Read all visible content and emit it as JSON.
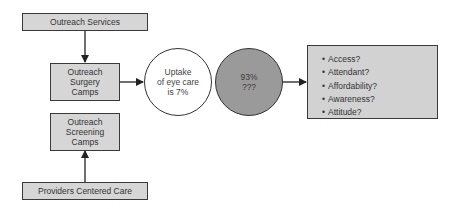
{
  "diagram": {
    "nodes": {
      "outreach_services": {
        "label": "Outreach Services"
      },
      "surgery_camps": {
        "lines": [
          "Outreach",
          "Surgery",
          "Camps"
        ]
      },
      "screening_camps": {
        "lines": [
          "Outreach",
          "Screening",
          "Camps"
        ]
      },
      "providers_care": {
        "label": "Providers Centered Care"
      },
      "uptake_circle": {
        "lines": [
          "Uptake",
          "of eye care",
          "is 7%"
        ]
      },
      "gap_circle": {
        "lines": [
          "93%",
          "???"
        ]
      },
      "barriers_list": {
        "bullet": "•",
        "items": [
          "Access?",
          "Attendant?",
          "Affordability?",
          "Awareness?",
          "Attitude?"
        ]
      }
    },
    "edges": [
      {
        "from": "outreach_services",
        "to": "surgery_camps"
      },
      {
        "from": "providers_care",
        "to": "screening_camps"
      },
      {
        "from": "surgery_camps",
        "to": "uptake_circle"
      },
      {
        "from": "gap_circle",
        "to": "barriers_list"
      }
    ],
    "colors": {
      "box_fill": "#d6d6d6",
      "gap_circle_fill": "#9a9a9a",
      "uptake_circle_fill": "#ffffff",
      "stroke": "#333333"
    }
  }
}
